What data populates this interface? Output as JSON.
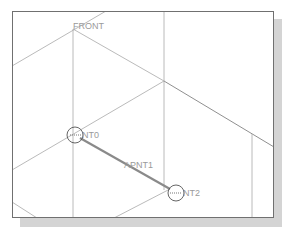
{
  "viewport": {
    "title_label": "FRONT",
    "frame_color": "#707070",
    "shadow_color": "#d4d4d4",
    "line_color": "#a8a8a8",
    "heavy_line_color": "#8a8a8a"
  },
  "points": [
    {
      "label": "PNT0",
      "display": "NT0",
      "x": 75,
      "y": 135,
      "marker": "circle"
    },
    {
      "label": "PNT1",
      "display": "APNT1",
      "x": 125,
      "y": 165,
      "marker": "none"
    },
    {
      "label": "PNT2",
      "display": "NT2",
      "x": 176,
      "y": 193,
      "marker": "circle"
    }
  ],
  "labels": {
    "front": "FRONT",
    "pnt0": "NT0",
    "pnt1": "APNT1",
    "pnt2": "NT2"
  }
}
